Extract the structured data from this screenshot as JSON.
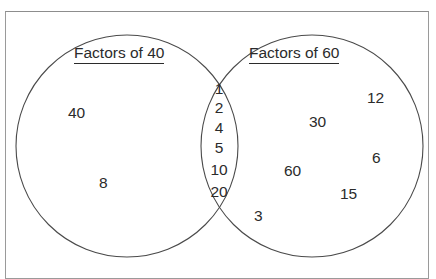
{
  "page": {
    "clipped_heading_above_frame": "Factors of",
    "frame_border_color": "#9a9a9a",
    "background_color": "#ffffff",
    "ink_color": "#2b2b2b"
  },
  "diagram": {
    "type": "venn",
    "left_set": {
      "title": "Factors of 40",
      "only_members": [
        "40",
        "8"
      ]
    },
    "right_set": {
      "title": "Factors of 60",
      "only_members": [
        "12",
        "30",
        "6",
        "60",
        "15",
        "3"
      ]
    },
    "intersection": {
      "members": [
        "1",
        "2",
        "4",
        "5",
        "10",
        "20"
      ]
    }
  }
}
